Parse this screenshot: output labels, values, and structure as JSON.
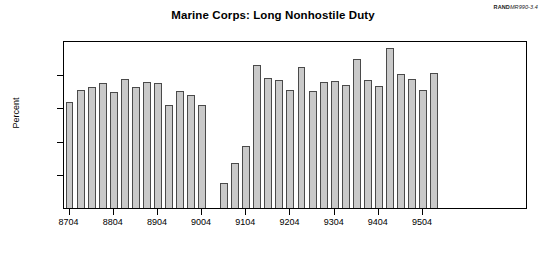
{
  "source_credit": {
    "brand": "RAND",
    "doc_id": "MR990-3.4"
  },
  "chart_data": {
    "type": "bar",
    "title": "Marine Corps:  Long Nonhostile Duty",
    "xlabel": "",
    "ylabel": "Percent",
    "ylim": [
      0,
      20
    ],
    "yticks": [
      0,
      4,
      8,
      12,
      16,
      20
    ],
    "ytick_labels": [
      "0",
      "4",
      "8",
      "12",
      "16",
      "20"
    ],
    "xtick_labels": [
      "8704",
      "8804",
      "8904",
      "9004",
      "9104",
      "9204",
      "9304",
      "9404",
      "9504"
    ],
    "xtick_categories": [
      "8704",
      "8804",
      "8904",
      "9004",
      "9104",
      "9204",
      "9304",
      "9404",
      "9504"
    ],
    "grid": false,
    "legend": null,
    "bar_color": "#c9c9c9",
    "bar_edge_color": "#4a4a4a",
    "categories": [
      "8704",
      "8707",
      "8710",
      "8801",
      "8804",
      "8807",
      "8810",
      "8901",
      "8904",
      "8907",
      "8910",
      "9001",
      "9004",
      "9007",
      "9010",
      "9101",
      "9104",
      "9107",
      "9110",
      "9201",
      "9204",
      "9207",
      "9210",
      "9301",
      "9304",
      "9307",
      "9310",
      "9401",
      "9404",
      "9407",
      "9410",
      "9501",
      "9504",
      "9507",
      "9510",
      "9601",
      "9604",
      "9607",
      "9610",
      "9701",
      "9704",
      "9707"
    ],
    "values": [
      12.6,
      14.0,
      14.4,
      14.9,
      13.8,
      15.3,
      14.4,
      15.0,
      14.9,
      12.3,
      13.9,
      13.4,
      12.3,
      0.0,
      3.0,
      5.4,
      7.4,
      17.0,
      15.5,
      15.2,
      14.1,
      16.8,
      13.9,
      15.0,
      15.1,
      14.7,
      17.7,
      15.2,
      14.5,
      19.1,
      15.9,
      15.4,
      14.0,
      16.1,
      0.0,
      0.0,
      0.0,
      0.0,
      0.0,
      0.0,
      0.0,
      0.0
    ]
  }
}
